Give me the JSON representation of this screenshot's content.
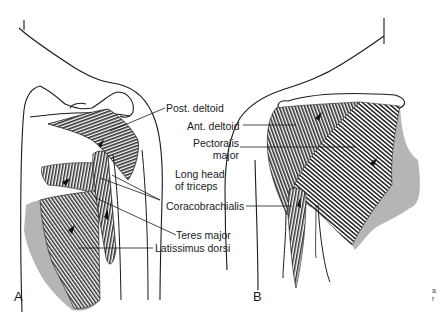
{
  "figure": {
    "panels": [
      {
        "letter": "A",
        "view": "posterior shoulder"
      },
      {
        "letter": "B",
        "view": "anterior shoulder"
      }
    ],
    "labels": {
      "post_deltoid": "Post. deltoid",
      "ant_deltoid": "Ant. deltoid",
      "pectoralis_line1": "Pectoralis",
      "pectoralis_line2": "major",
      "long_head_line1": "Long head",
      "long_head_line2": "of triceps",
      "coracobrachialis": "Coracobrachialis",
      "teres_major": "Teres major",
      "latissimus_dorsi": "Latissimus dorsi"
    },
    "edge_fragment": {
      "line1": "a",
      "line2": "r"
    },
    "colors": {
      "ink": "#1a1a1a",
      "muscle_dark": "#3a3a3a",
      "muscle_shade": "#b5b5b5",
      "background": "#ffffff"
    }
  }
}
